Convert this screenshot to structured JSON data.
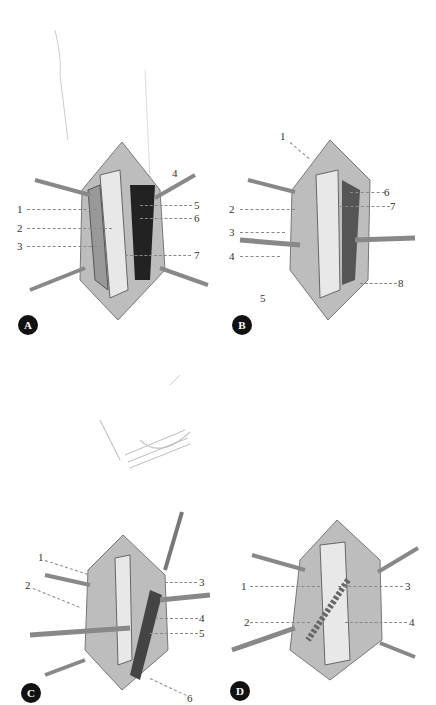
{
  "figure": {
    "panels": [
      {
        "id": "A",
        "badge": "A",
        "labels": [
          "1",
          "2",
          "3",
          "4",
          "5",
          "6",
          "7"
        ]
      },
      {
        "id": "B",
        "badge": "B",
        "labels": [
          "1",
          "2",
          "3",
          "4",
          "5",
          "6",
          "7",
          "8"
        ]
      },
      {
        "id": "C",
        "badge": "C",
        "labels": [
          "1",
          "2",
          "3",
          "4",
          "5",
          "6"
        ]
      },
      {
        "id": "D",
        "badge": "D",
        "labels": [
          "1",
          "2",
          "3",
          "4"
        ]
      }
    ]
  },
  "colors": {
    "badge_bg": "#111111",
    "badge_text": "#ffffff",
    "leader_line": "#888888",
    "tissue_dark": "#2a2a2a",
    "tissue_mid": "#8a8a8a",
    "tissue_light": "#d8d8d8"
  }
}
